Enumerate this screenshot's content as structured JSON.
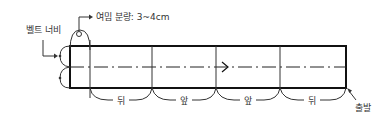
{
  "diagram": {
    "title_margin_label": "여밈 분량: 3~4cm",
    "belt_width_label": "벨트 너비",
    "start_label": "출발",
    "segments": [
      {
        "label": "뒤"
      },
      {
        "label": "앞"
      },
      {
        "label": "앞"
      },
      {
        "label": "뒤"
      }
    ],
    "colors": {
      "line": "#111111",
      "text": "#333333",
      "background": "#ffffff"
    }
  }
}
